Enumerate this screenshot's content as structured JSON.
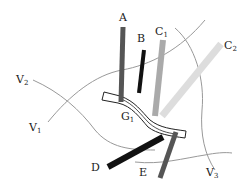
{
  "diagram": {
    "labels": {
      "A": "A",
      "B": "B",
      "C1_main": "C",
      "C1_sub": "1",
      "C2_main": "C",
      "C2_sub": "2",
      "V1_main": "V",
      "V1_sub": "1",
      "V2_main": "V",
      "V2_sub": "2",
      "V3_main": "V",
      "V3_sub": "3",
      "G1_main": "G",
      "G1_sub": "1",
      "D": "D",
      "E": "E"
    },
    "colors": {
      "bar_A": "#555555",
      "bar_B": "#111111",
      "bar_C1": "#aaaaaa",
      "bar_C2": "#dddddd",
      "bar_D": "#111111",
      "bar_E": "#555555",
      "curves": "#999999",
      "band_outline": "#222222"
    }
  }
}
